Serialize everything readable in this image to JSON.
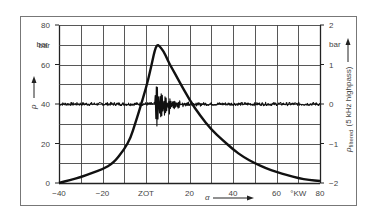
{
  "chart_data": {
    "type": "line",
    "title": "",
    "xlabel": "α",
    "x_unit": "°KW",
    "ylabel_left": "p",
    "ylabel_left_unit": "bar",
    "ylabel_right": "p_filtered (5 kHz highpass)",
    "ylabel_right_unit": "bar",
    "xlim": [
      -40,
      80
    ],
    "ylim_left": [
      0,
      80
    ],
    "ylim_right": [
      -2,
      2
    ],
    "grid": true,
    "x_ticks": [
      -40,
      -20,
      "ZOT",
      20,
      40,
      60,
      "°KW",
      80
    ],
    "y_left_ticks": [
      0,
      20,
      40,
      60,
      "bar",
      80
    ],
    "y_right_ticks": [
      -2,
      -1,
      0,
      1,
      "bar",
      2
    ],
    "series": [
      {
        "name": "Cylinder pressure p",
        "axis": "left",
        "x": [
          -40,
          -35,
          -30,
          -25,
          -20,
          -15,
          -10,
          -7,
          -5,
          -3,
          0,
          2,
          3,
          4,
          5,
          6,
          8,
          10,
          12,
          15,
          20,
          25,
          30,
          35,
          40,
          45,
          50,
          55,
          60,
          65,
          70,
          75,
          80
        ],
        "values": [
          0,
          1.5,
          3,
          5,
          7,
          10,
          17,
          23,
          30,
          37,
          48,
          57,
          62,
          67,
          70,
          69.5,
          67,
          62,
          58,
          52,
          42,
          34,
          27,
          22,
          17,
          13,
          10,
          7.5,
          5.5,
          4,
          2.5,
          1.5,
          1
        ]
      },
      {
        "name": "Filtered pressure (5 kHz highpass)",
        "axis": "right",
        "description": "Near-zero baseline noise with knocking oscillations starting at about 4 °KW, max amplitude about -0.9/+0.6 bar, decaying by about 25 °KW",
        "oscillation_start": 4,
        "oscillation_end": 25,
        "max_positive": 0.6,
        "max_negative": -0.9
      }
    ]
  },
  "labels": {
    "left_unit": "bar",
    "right_unit": "bar",
    "left_symbol": "p",
    "right_symbol_main": "p",
    "right_symbol_sub": "filtered",
    "right_symbol_tail": "(5 kHz highpass)",
    "x_symbol": "α",
    "x_unit": "°KW",
    "zot": "ZOT"
  }
}
